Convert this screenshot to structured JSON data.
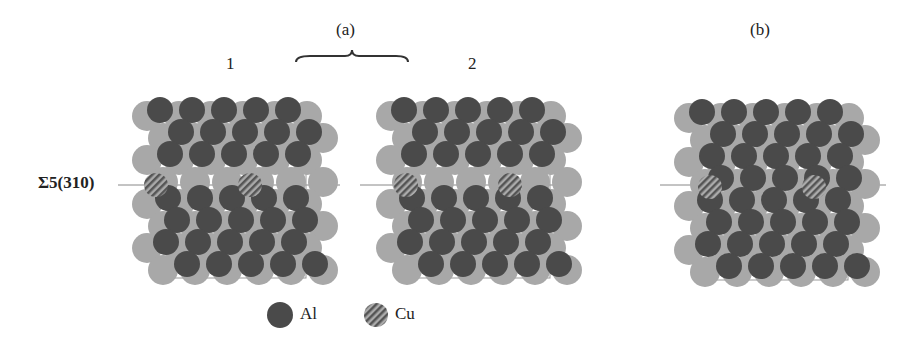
{
  "labels": {
    "group_a": "(a)",
    "panel_1": "1",
    "panel_2": "2",
    "panel_b": "(b)",
    "boundary": "Σ5(310)"
  },
  "legend": [
    {
      "label": "Al",
      "style": "solid-dark"
    },
    {
      "label": "Cu",
      "style": "hatched"
    }
  ],
  "colors": {
    "al_dark": "#4a4a4a",
    "al_light": "#a8a8a8",
    "cu": "#777777"
  }
}
